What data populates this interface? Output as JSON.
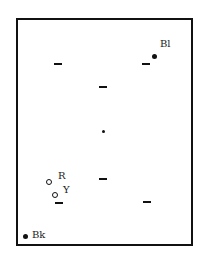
{
  "diagram": {
    "type": "point-layout-in-frame",
    "frame": {
      "left": 16,
      "top": 18,
      "right": 191,
      "bottom": 244,
      "stroke": "#111111"
    },
    "dashes": [
      {
        "id": "dash-1",
        "x": 54,
        "y": 63
      },
      {
        "id": "dash-2",
        "x": 142,
        "y": 63
      },
      {
        "id": "dash-3",
        "x": 99,
        "y": 86
      },
      {
        "id": "dash-4",
        "x": 99,
        "y": 178
      },
      {
        "id": "dash-5",
        "x": 55,
        "y": 202
      },
      {
        "id": "dash-6",
        "x": 143,
        "y": 201
      }
    ],
    "center_dot": {
      "x": 103,
      "y": 131
    },
    "points": [
      {
        "id": "Bl",
        "label": "Bl",
        "style": "filled",
        "x": 154,
        "y": 56,
        "label_x": 161,
        "label_y": 39
      },
      {
        "id": "R",
        "label": "R",
        "style": "open",
        "x": 49,
        "y": 182,
        "label_x": 58,
        "label_y": 171
      },
      {
        "id": "Y",
        "label": "Y",
        "style": "open",
        "x": 55,
        "y": 195,
        "label_x": 63,
        "label_y": 185
      },
      {
        "id": "Bk",
        "label": "Bk",
        "style": "filled",
        "x": 25,
        "y": 236,
        "label_x": 32,
        "label_y": 230
      }
    ]
  },
  "labels": {
    "bl": "Bl",
    "r": "R",
    "y": "Y",
    "bk": "Bk"
  }
}
